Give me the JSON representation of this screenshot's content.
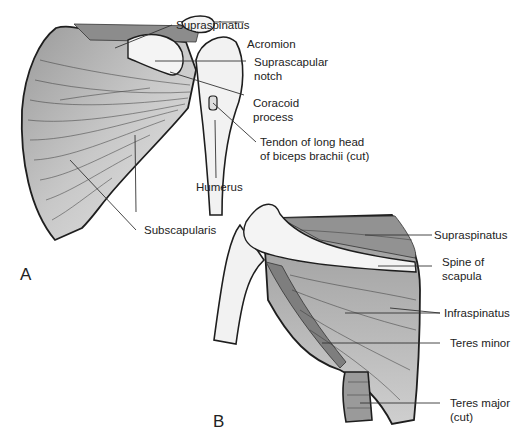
{
  "figure": {
    "panels": [
      {
        "id": "A",
        "label": "A",
        "view": "anterior",
        "labels": {
          "supraspinatus": "Supraspinatus",
          "acromion": "Acromion",
          "suprascapular_notch_1": "Suprascapular",
          "suprascapular_notch_2": "notch",
          "coracoid_1": "Coracoid",
          "coracoid_2": "process",
          "tendon_1": "Tendon of long head",
          "tendon_2": "of biceps brachii (cut)",
          "humerus": "Humerus",
          "subscapularis": "Subscapularis"
        }
      },
      {
        "id": "B",
        "label": "B",
        "view": "posterior",
        "labels": {
          "supraspinatus": "Supraspinatus",
          "spine_1": "Spine of",
          "spine_2": "scapula",
          "infraspinatus": "Infraspinatus",
          "teres_minor": "Teres minor",
          "teres_major_1": "Teres major",
          "teres_major_2": "(cut)"
        }
      }
    ],
    "colors": {
      "outline": "#1e1e1e",
      "muscle_dark": "#8a8a8a",
      "muscle_mid": "#b4b4b4",
      "bone": "#eeeeee",
      "leader": "#333333"
    }
  }
}
